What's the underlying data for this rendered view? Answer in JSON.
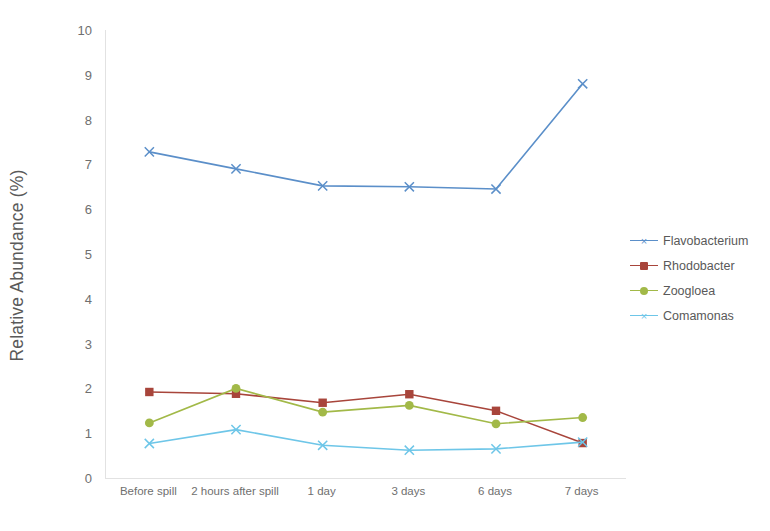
{
  "chart_data": {
    "type": "line",
    "title": "",
    "subtitle": "",
    "xlabel": "",
    "ylabel": "Relative Abundance (%)",
    "categories": [
      "Before spill",
      "2 hours after spill",
      "1 day",
      "3 days",
      "6 days",
      "7 days"
    ],
    "ylim": [
      0,
      10
    ],
    "yticks": [
      0,
      1,
      2,
      3,
      4,
      5,
      6,
      7,
      8,
      9,
      10
    ],
    "ytick_labels": [
      "0",
      "1",
      "2",
      "3",
      "4",
      "5",
      "6",
      "7",
      "8",
      "9",
      "10"
    ],
    "grid": false,
    "legend_position": "right",
    "series": [
      {
        "name": "Flavobacterium",
        "color": "#5b8fc9",
        "marker": "cross",
        "marker_glyph": "×",
        "values": [
          7.28,
          6.9,
          6.52,
          6.5,
          6.45,
          8.8
        ]
      },
      {
        "name": "Rhodobacter",
        "color": "#a8453b",
        "marker": "square",
        "marker_glyph": "■",
        "values": [
          1.92,
          1.88,
          1.68,
          1.87,
          1.5,
          0.78
        ]
      },
      {
        "name": "Zoogloea",
        "color": "#a2b948",
        "marker": "circle",
        "marker_glyph": "●",
        "values": [
          1.23,
          2.0,
          1.47,
          1.62,
          1.21,
          1.35
        ]
      },
      {
        "name": "Comamonas",
        "color": "#6ec6e8",
        "marker": "cross",
        "marker_glyph": "×",
        "values": [
          0.77,
          1.08,
          0.73,
          0.62,
          0.65,
          0.8
        ]
      }
    ]
  },
  "axis": {
    "frame_color": "#e2e2e2"
  }
}
